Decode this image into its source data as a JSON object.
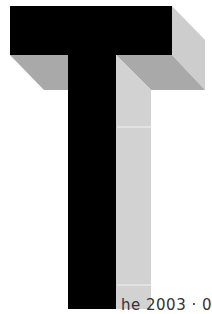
{
  "figure": {
    "letter": "T",
    "colors": {
      "front_face": "#000000",
      "underside_face": "#a9a9a9",
      "side_face": "#cdcdcd",
      "stem_side_face": "#d2d2d2",
      "seam_line": "#f2f2f2",
      "background": "#ffffff"
    }
  },
  "caption": {
    "text": "he 2003 · 0"
  }
}
